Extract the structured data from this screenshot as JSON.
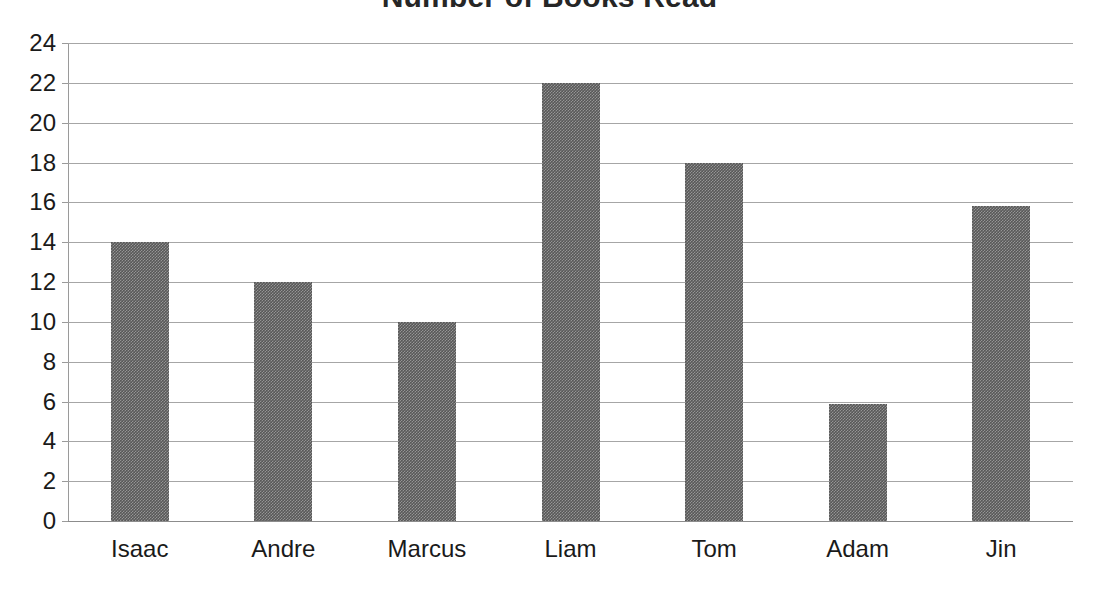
{
  "chart_data": {
    "type": "bar",
    "title": "Number of Books Read",
    "xlabel": "",
    "ylabel": "",
    "categories": [
      "Isaac",
      "Andre",
      "Marcus",
      "Liam",
      "Tom",
      "Adam",
      "Jin"
    ],
    "values": [
      14,
      12,
      10,
      22,
      18,
      5.9,
      15.8
    ],
    "ylim": [
      0,
      24
    ],
    "y_ticks": [
      0,
      2,
      4,
      6,
      8,
      10,
      12,
      14,
      16,
      18,
      20,
      22,
      24
    ],
    "grid": true,
    "legend": false,
    "legend_position": "none",
    "series": [
      {
        "name": "Books Read",
        "values": [
          14,
          12,
          10,
          22,
          18,
          5.9,
          15.8
        ],
        "color": "#585858"
      }
    ]
  },
  "colors": {
    "bar_fill": "#585858",
    "gridline": "#a6a6a6",
    "axis": "#9a9a9a",
    "text": "#1a1a1a",
    "title": "#262626",
    "background": "#ffffff"
  }
}
